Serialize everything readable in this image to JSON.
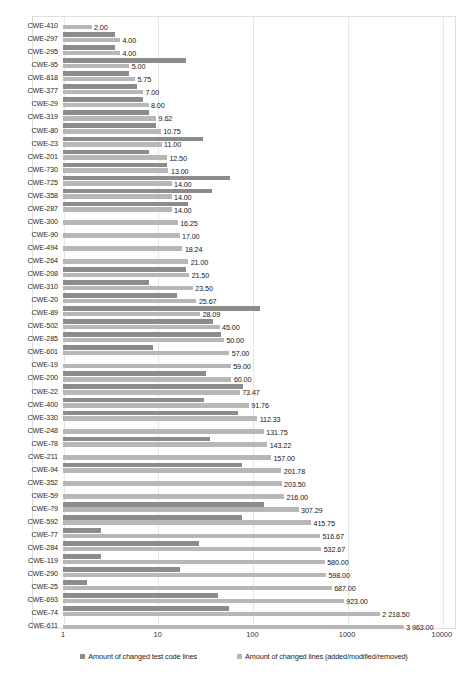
{
  "chart_data": {
    "type": "bar",
    "orientation": "horizontal",
    "scale": "log",
    "title": "",
    "xlabel": "",
    "ylabel": "",
    "xlim": [
      1,
      10000
    ],
    "xticks": [
      "1",
      "10",
      "100",
      "1000",
      "10000"
    ],
    "xtick_values": [
      1,
      10,
      100,
      1000,
      10000
    ],
    "grid": true,
    "legend_position": "bottom",
    "colors": {
      "test_code_lines": "#8c8c8c",
      "changed_lines": "#b7b7b7",
      "gridline": "#e6e6e6",
      "frame": "#dedede"
    },
    "categories": [
      "CWE-410",
      "CWE-297",
      "CWE-295",
      "CWE-95",
      "CWE-818",
      "CWE-377",
      "CWE-29",
      "CWE-319",
      "CWE-80",
      "CWE-23",
      "CWE-201",
      "CWE-730",
      "CWE-725",
      "CWE-358",
      "CWE-287",
      "CWE-300",
      "CWE-90",
      "CWE-494",
      "CWE-264",
      "CWE-208",
      "CWE-310",
      "CWE-20",
      "CWE-89",
      "CWE-502",
      "CWE-285",
      "CWE-601",
      "CWE-19",
      "CWE-200",
      "CWE-22",
      "CWE-400",
      "CWE-330",
      "CWE-248",
      "CWE-78",
      "CWE-211",
      "CWE-94",
      "CWE-352",
      "CWE-59",
      "CWE-79",
      "CWE-592",
      "CWE-77",
      "CWE-284",
      "CWE-119",
      "CWE-290",
      "CWE-25",
      "CWE-693",
      "CWE-74",
      "CWE-611"
    ],
    "series": [
      {
        "name": "Amount of changed lines (added/modified/removed)",
        "key": "changed_lines",
        "color": "#b7b7b7",
        "values": [
          2.0,
          4.0,
          4.0,
          5.0,
          5.75,
          7.0,
          8.0,
          9.62,
          10.75,
          11.0,
          12.5,
          13.0,
          14.0,
          14.0,
          14.0,
          16.25,
          17.0,
          18.24,
          21.0,
          21.5,
          23.5,
          25.67,
          28.09,
          45.0,
          50.0,
          57.0,
          59.0,
          60.0,
          73.47,
          91.76,
          112.33,
          131.75,
          143.22,
          157.0,
          201.78,
          203.5,
          216.0,
          307.29,
          415.75,
          516.67,
          532.67,
          580.0,
          598.0,
          687.0,
          923.0,
          2218.5,
          3963.0
        ],
        "labels": [
          "2.00",
          "4.00",
          "4.00",
          "5.00",
          "5.75",
          "7.00",
          "8.00",
          "9.62",
          "10.75",
          "11.00",
          "12.50",
          "13.00",
          "14.00",
          "14.00",
          "14.00",
          "16.25",
          "17.00",
          "18.24",
          "21.00",
          "21.50",
          "23.50",
          "25.67",
          "28.09",
          "45.00",
          "50.00",
          "57.00",
          "59.00",
          "60.00",
          "73.47",
          "91.76",
          "112.33",
          "131.75",
          "143.22",
          "157.00",
          "201.78",
          "203.50",
          "216.00",
          "307.29",
          "415.75",
          "516.67",
          "532.67",
          "580.00",
          "598.00",
          "687.00",
          "923.00",
          "2 218.50",
          "3 963.00"
        ]
      },
      {
        "name": "Amount of changed test code lines",
        "key": "test_code_lines",
        "color": "#8c8c8c",
        "values": [
          0,
          3.5,
          3.5,
          20.0,
          5.0,
          6.0,
          7.0,
          8.0,
          9.5,
          30.0,
          8.0,
          12.5,
          58.0,
          37.0,
          21.0,
          0,
          0,
          0,
          0,
          20.0,
          8.0,
          16.0,
          120.0,
          38.0,
          47.0,
          9.0,
          0,
          32.0,
          80.0,
          31.0,
          70.0,
          0,
          36.0,
          0,
          77.0,
          0,
          0,
          131.0,
          78.0,
          2.5,
          27.0,
          2.5,
          17.0,
          1.8,
          43.0,
          56.0,
          0
        ]
      }
    ]
  },
  "legend": {
    "items": [
      {
        "label": "Amount of changed test code lines",
        "swatch": "dark"
      },
      {
        "label": "Amount of changed lines (added/modified/removed)",
        "swatch": "light"
      }
    ]
  }
}
